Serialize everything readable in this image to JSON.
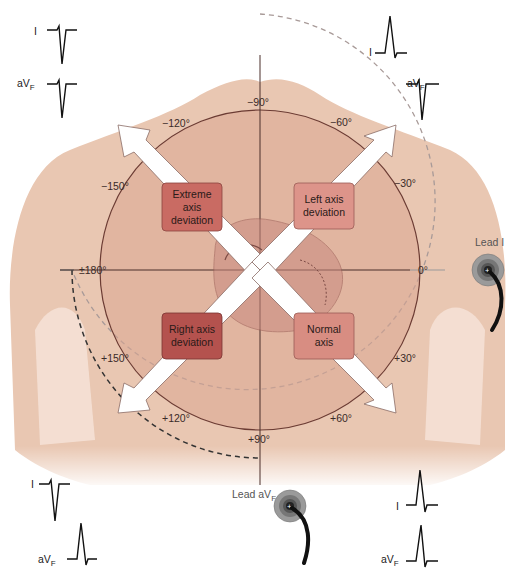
{
  "colors": {
    "skin": "#ecd0bd",
    "skin_shadow": "#dcb39c",
    "inner_circle": "#d9a590",
    "circle_stroke": "#6b3b33",
    "extreme_box": "#c96b63",
    "left_box": "#dd948a",
    "right_box": "#b4524e",
    "normal_box": "#d88d82",
    "arrow": "#ffffff",
    "dashed": "#9a8a88",
    "ecg": "#111111"
  },
  "degrees": {
    "m90": "−90°",
    "m120": "−120°",
    "m60": "−60°",
    "m150": "−150°",
    "m30": "−30°",
    "p180": "±180°",
    "zero": "0°",
    "p150": "+150°",
    "p30": "+30°",
    "p120": "+120°",
    "p60": "+60°",
    "p90": "+90°"
  },
  "quadrants": {
    "extreme": {
      "line1": "Extreme",
      "line2": "axis",
      "line3": "deviation"
    },
    "left": {
      "line1": "Left axis",
      "line2": "deviation"
    },
    "right": {
      "line1": "Right axis",
      "line2": "deviation"
    },
    "normal": {
      "line1": "Normal",
      "line2": "axis"
    }
  },
  "electrodes": {
    "lead_i": {
      "label": "Lead I",
      "sign": "+"
    },
    "lead_avf": {
      "label": "Lead aV",
      "sub": "F",
      "sign": "+"
    }
  },
  "ecg_panels": {
    "top_left": {
      "lead1": "I",
      "lead2": "aV",
      "lead2_sub": "F",
      "lead1_polarity": "negative",
      "lead2_polarity": "negative"
    },
    "top_right": {
      "lead1": "I",
      "lead2": "aV",
      "lead2_sub": "F",
      "lead1_polarity": "positive",
      "lead2_polarity": "negative"
    },
    "bottom_left": {
      "lead1": "I",
      "lead2": "aV",
      "lead2_sub": "F",
      "lead1_polarity": "negative",
      "lead2_polarity": "positive"
    },
    "bottom_right": {
      "lead1": "I",
      "lead2": "aV",
      "lead2_sub": "F",
      "lead1_polarity": "positive",
      "lead2_polarity": "positive"
    }
  }
}
